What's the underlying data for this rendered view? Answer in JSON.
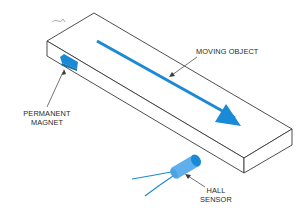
{
  "diagram": {
    "type": "hall-effect-sensor-illustration",
    "labels": {
      "moving_object": "MOVING OBJECT",
      "permanent_magnet_line1": "PERMANENT",
      "permanent_magnet_line2": "MAGNET",
      "hall_sensor_line1": "HALL",
      "hall_sensor_line2": "SENSOR"
    },
    "colors": {
      "accent_blue": "#1b8ad6",
      "sensor_light_blue": "#5fb0ea",
      "outline": "#3a3a3a",
      "text": "#2a2a2a"
    }
  }
}
